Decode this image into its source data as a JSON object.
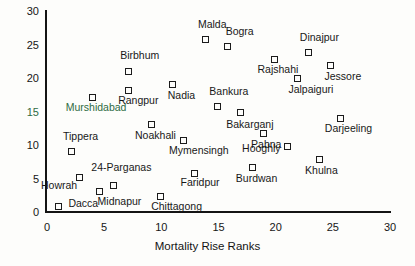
{
  "chart_data": {
    "type": "scatter",
    "title": "",
    "xlabel": "Mortality Rise Ranks",
    "ylabel": "",
    "xlim": [
      0,
      30
    ],
    "ylim": [
      0,
      30
    ],
    "xticks": [
      0,
      5,
      10,
      15,
      20,
      25,
      30
    ],
    "yticks": [
      0,
      5,
      10,
      15,
      20,
      25,
      30
    ],
    "grid": false,
    "legend": "none",
    "marker_style": "open-square",
    "points": [
      {
        "label": "Dacca",
        "x": 1,
        "y": 0.8,
        "label_dx": 10,
        "label_dy": -4,
        "color": "#181818"
      },
      {
        "label": "Midnapur",
        "x": 4.6,
        "y": 3.0,
        "label_dx": -2,
        "label_dy": 9,
        "color": "#181818"
      },
      {
        "label": "24-Parganas",
        "x": 5.8,
        "y": 4.0,
        "label_dx": -22,
        "label_dy": -18,
        "color": "#181818"
      },
      {
        "label": "Howrah",
        "x": 2.8,
        "y": 5.2,
        "label_dx": -38,
        "label_dy": 8,
        "color": "#181818"
      },
      {
        "label": "Chittagong",
        "x": 9.9,
        "y": 2.3,
        "label_dx": -9,
        "label_dy": 9,
        "color": "#181818"
      },
      {
        "label": "Tippera",
        "x": 2.1,
        "y": 9.1,
        "label_dx": -8,
        "label_dy": -15,
        "color": "#181818"
      },
      {
        "label": "Faridpur",
        "x": 12.9,
        "y": 5.8,
        "label_dx": -14,
        "label_dy": 9,
        "color": "#181818"
      },
      {
        "label": "Burdwan",
        "x": 18.0,
        "y": 6.6,
        "label_dx": -17,
        "label_dy": 10,
        "color": "#181818"
      },
      {
        "label": "Khulna",
        "x": 23.8,
        "y": 7.8,
        "label_dx": -14,
        "label_dy": 10,
        "color": "#181818"
      },
      {
        "label": "Hooghly",
        "x": 21.0,
        "y": 9.8,
        "label_dx": -45,
        "label_dy": 2,
        "color": "#181818"
      },
      {
        "label": "Mymensingh",
        "x": 11.9,
        "y": 10.7,
        "label_dx": -14,
        "label_dy": 10,
        "color": "#181818"
      },
      {
        "label": "Pabna",
        "x": 18.9,
        "y": 11.7,
        "label_dx": -12,
        "label_dy": 10,
        "color": "#181818"
      },
      {
        "label": "Noakhali",
        "x": 9.1,
        "y": 13.0,
        "label_dx": -16,
        "label_dy": 10,
        "color": "#181818"
      },
      {
        "label": "Darjeeling",
        "x": 25.7,
        "y": 14.0,
        "label_dx": -16,
        "label_dy": 10,
        "color": "#181818"
      },
      {
        "label": "Bakarganj",
        "x": 16.9,
        "y": 14.8,
        "label_dx": -14,
        "label_dy": 11,
        "color": "#181818"
      },
      {
        "label": "Bankura",
        "x": 14.9,
        "y": 15.7,
        "label_dx": -8,
        "label_dy": -16,
        "color": "#181818"
      },
      {
        "label": "Murshidabad",
        "x": 4.0,
        "y": 17.1,
        "label_dx": -27,
        "label_dy": 10,
        "color": "#2f6b43"
      },
      {
        "label": "Rangpur",
        "x": 7.1,
        "y": 18.2,
        "label_dx": -10,
        "label_dy": 10,
        "color": "#181818"
      },
      {
        "label": "Nadia",
        "x": 11.0,
        "y": 19.0,
        "label_dx": -5,
        "label_dy": 10,
        "color": "#181818"
      },
      {
        "label": "Jalpaiguri",
        "x": 21.9,
        "y": 19.9,
        "label_dx": -9,
        "label_dy": 10,
        "color": "#181818"
      },
      {
        "label": "Birbhum",
        "x": 7.1,
        "y": 21.0,
        "label_dx": -8,
        "label_dy": -16,
        "color": "#181818"
      },
      {
        "label": "Jessore",
        "x": 24.8,
        "y": 21.8,
        "label_dx": -6,
        "label_dy": 10,
        "color": "#181818"
      },
      {
        "label": "Rajshahi",
        "x": 19.9,
        "y": 22.8,
        "label_dx": -17,
        "label_dy": 10,
        "color": "#181818"
      },
      {
        "label": "Dinajpur",
        "x": 22.9,
        "y": 23.8,
        "label_dx": -9,
        "label_dy": -16,
        "color": "#181818"
      },
      {
        "label": "Bogra",
        "x": 15.8,
        "y": 24.7,
        "label_dx": -2,
        "label_dy": -16,
        "color": "#181818"
      },
      {
        "label": "Malda",
        "x": 13.9,
        "y": 25.7,
        "label_dx": -8,
        "label_dy": -16,
        "color": "#181818"
      }
    ]
  },
  "axis": {
    "x_title": "Mortality Rise Ranks",
    "x_tick_labels": [
      "0",
      "5",
      "10",
      "15",
      "20",
      "25",
      "30"
    ],
    "y_tick_labels": [
      "0",
      "5",
      "10",
      "15",
      "20",
      "25",
      "30"
    ],
    "highlight_y_tick": "15",
    "highlight_color": "#2f6b43"
  }
}
